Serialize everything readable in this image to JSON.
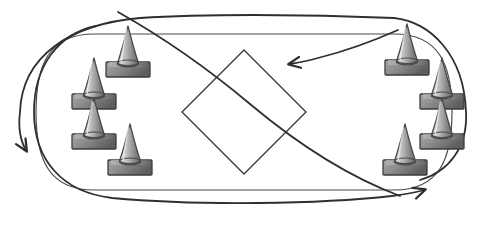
{
  "diagram": {
    "background_color": "#ffffff",
    "line_color": "#3a3a3a",
    "canvas": {
      "width": 488,
      "height": 230
    },
    "track": {
      "name": "oval-track-outline",
      "shape": "stadium",
      "stroke": "#4a4a4a",
      "stroke_width": 1.2,
      "left": 16,
      "top": 34,
      "right": 452,
      "bottom": 190,
      "corner_radius": 78
    },
    "center_diamond": {
      "name": "center-diamond",
      "shape": "rotated-square",
      "stroke": "#3a3a3a",
      "stroke_width": 1.4,
      "center_x": 244,
      "center_y": 112,
      "half_diagonal": 62,
      "rotation_deg": 45
    },
    "arrows": [
      {
        "name": "outer-figure-eight-arrow",
        "stroke": "#2f2f2f",
        "stroke_width": 1.8,
        "arrowhead_at": "left",
        "arrowhead_x": 25,
        "arrowhead_y": 148,
        "direction": "counter-clockwise"
      },
      {
        "name": "inner-figure-eight-arrow",
        "stroke": "#2f2f2f",
        "stroke_width": 1.8,
        "arrowhead_at": "right",
        "arrowhead_x": 426,
        "arrowhead_y": 191,
        "direction": "clockwise"
      },
      {
        "name": "crossing-arrow-into-center",
        "stroke": "#2f2f2f",
        "stroke_width": 1.8,
        "arrowhead_at": "center-left",
        "arrowhead_x": 288,
        "arrowhead_y": 63,
        "direction": "inward"
      }
    ],
    "cones": {
      "count": 8,
      "style": {
        "body_light": "#d8d8d8",
        "body_mid": "#a8a8a8",
        "body_dark": "#6e6e6e",
        "outline": "#4a4a4a",
        "base_light": "#9a9a9a",
        "base_dark": "#5c5c5c",
        "base_outline": "#3c3c3c"
      },
      "group_left": [
        {
          "name": "cone-left-top",
          "x": 104,
          "y": 24,
          "scale": 1.0
        },
        {
          "name": "cone-left-upper",
          "x": 70,
          "y": 56,
          "scale": 1.0
        },
        {
          "name": "cone-left-lower",
          "x": 70,
          "y": 96,
          "scale": 1.0
        },
        {
          "name": "cone-left-bottom",
          "x": 106,
          "y": 122,
          "scale": 1.0
        }
      ],
      "group_right": [
        {
          "name": "cone-right-top",
          "x": 383,
          "y": 22,
          "scale": 1.0
        },
        {
          "name": "cone-right-upper",
          "x": 418,
          "y": 56,
          "scale": 1.0
        },
        {
          "name": "cone-right-lower",
          "x": 418,
          "y": 96,
          "scale": 1.0
        },
        {
          "name": "cone-right-bottom",
          "x": 381,
          "y": 122,
          "scale": 1.0
        }
      ]
    }
  }
}
